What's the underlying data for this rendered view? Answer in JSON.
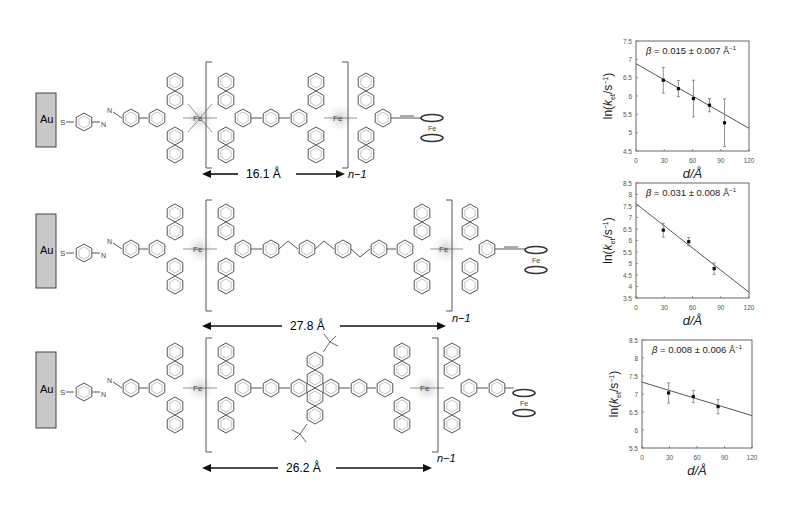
{
  "figure": {
    "rows": [
      {
        "id": "row-1",
        "electrode": "Au",
        "anchor": "S",
        "linker": "azobenzene",
        "metal_label": "Fe",
        "terminal": "ferrocene",
        "terminal_metal": "Fe",
        "repeat_label": "n−1",
        "distance_label": "16.1 Å",
        "bridge": "phenylene"
      },
      {
        "id": "row-2",
        "electrode": "Au",
        "anchor": "S",
        "linker": "azobenzene",
        "metal_label": "Fe",
        "terminal": "ferrocene",
        "terminal_metal": "Fe",
        "repeat_label": "n−1",
        "distance_label": "27.8 Å",
        "bridge": "oligo(phenylene-vinylene)"
      },
      {
        "id": "row-3",
        "electrode": "Au",
        "anchor": "S",
        "linker": "azobenzene",
        "metal_label": "Fe",
        "terminal": "ferrocene",
        "terminal_metal": "Fe",
        "repeat_label": "n−1",
        "distance_label": "26.2 Å",
        "bridge": "di-tert-butyl dihydropyrene"
      }
    ],
    "atom_labels": {
      "nitrogen": "N",
      "iron": "Fe",
      "sulfur": "S",
      "gold": "Au"
    }
  },
  "chart_data": [
    {
      "type": "scatter",
      "title": "",
      "annotation": "β = 0.015 ± 0.007 Å⁻¹",
      "annotation_parts": {
        "symbol": "β",
        "eq": " = ",
        "value": "0.015 ± 0.007 Å",
        "sup": "−1"
      },
      "xlabel": "d/Å",
      "ylabel": "ln(k_et/s⁻¹)",
      "xlim": [
        0,
        120
      ],
      "ylim": [
        4.5,
        7.5
      ],
      "xticks": [
        0,
        30,
        60,
        90,
        120
      ],
      "yticks": [
        4.5,
        5,
        5.5,
        6,
        6.5,
        7,
        7.5
      ],
      "grid": false,
      "legend": "none",
      "points": [
        {
          "x": 29,
          "y": 6.43,
          "err": 0.35
        },
        {
          "x": 45,
          "y": 6.2,
          "err": 0.22
        },
        {
          "x": 61,
          "y": 5.93,
          "err": 0.5
        },
        {
          "x": 78,
          "y": 5.75,
          "err": 0.18
        },
        {
          "x": 94,
          "y": 5.27,
          "err": 0.65
        }
      ],
      "fit": {
        "x0": 0,
        "y0": 6.88,
        "x1": 120,
        "y1": 5.12
      }
    },
    {
      "type": "scatter",
      "title": "",
      "annotation": "β = 0.031 ± 0.008 Å⁻¹",
      "annotation_parts": {
        "symbol": "β",
        "eq": " = ",
        "value": "0.031 ± 0.008 Å",
        "sup": "−1"
      },
      "xlabel": "d/Å",
      "ylabel": "ln(k_et/s⁻¹)",
      "xlim": [
        0,
        120
      ],
      "ylim": [
        3.5,
        8.5
      ],
      "xticks": [
        0,
        30,
        60,
        90,
        120
      ],
      "yticks": [
        3.5,
        4,
        4.5,
        5,
        5.5,
        6,
        6.5,
        7,
        7.5,
        8,
        8.5
      ],
      "grid": false,
      "legend": "none",
      "points": [
        {
          "x": 29,
          "y": 6.45,
          "err": 0.3
        },
        {
          "x": 56,
          "y": 5.95,
          "err": 0.18
        },
        {
          "x": 83,
          "y": 4.78,
          "err": 0.25
        }
      ],
      "fit": {
        "x0": 0,
        "y0": 7.6,
        "x1": 120,
        "y1": 3.75
      }
    },
    {
      "type": "scatter",
      "title": "",
      "annotation": "β = 0.008 ± 0.006 Å⁻¹",
      "annotation_parts": {
        "symbol": "β",
        "eq": " = ",
        "value": "0.008 ± 0.006 Å",
        "sup": "−1"
      },
      "xlabel": "d/Å",
      "ylabel": "ln(k_et/s⁻¹)",
      "xlim": [
        0,
        120
      ],
      "ylim": [
        5.5,
        8.5
      ],
      "xticks": [
        0,
        30,
        60,
        90,
        120
      ],
      "yticks": [
        5.5,
        6,
        6.5,
        7,
        7.5,
        8,
        8.5
      ],
      "grid": false,
      "legend": "none",
      "points": [
        {
          "x": 29,
          "y": 7.03,
          "err": 0.28
        },
        {
          "x": 56,
          "y": 6.93,
          "err": 0.17
        },
        {
          "x": 83,
          "y": 6.65,
          "err": 0.2
        }
      ],
      "fit": {
        "x0": 0,
        "y0": 7.33,
        "x1": 120,
        "y1": 6.4
      }
    }
  ]
}
